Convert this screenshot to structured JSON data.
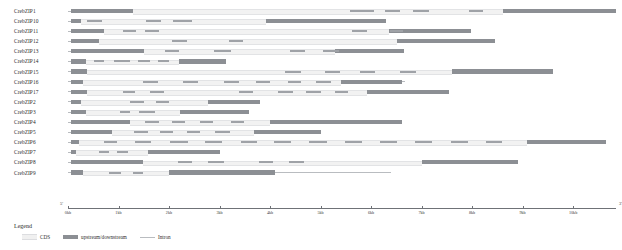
{
  "chart_data": {
    "type": "gene-structure-diagram",
    "title": "",
    "xlabel": "",
    "ylabel": "",
    "xlim": [
      0,
      10.85
    ],
    "x_unit": "kb",
    "axis_start_label": "5'",
    "axis_end_label": "3'",
    "grid": false,
    "tick_values": [
      0,
      1,
      2,
      3,
      4,
      5,
      6,
      7,
      8,
      9,
      10
    ],
    "tick_labels": [
      "0kb",
      "1kb",
      "2kb",
      "3kb",
      "4kb",
      "5kb",
      "6kb",
      "7kb",
      "8kb",
      "9kb",
      "10kb"
    ],
    "legend": {
      "title": "Legend",
      "position": "bottom-left",
      "entries": [
        {
          "name": "CDS",
          "color": "#f0f0f0",
          "shape": "block"
        },
        {
          "name": "upstream/downstream",
          "color": "#8c8f94",
          "shape": "block"
        },
        {
          "name": "Intron",
          "color": "#b9bcc0",
          "shape": "line"
        }
      ]
    },
    "categories": [
      "CrebZIP1",
      "CrebZIP10",
      "CrebZIP11",
      "CrebZIP12",
      "CrebZIP13",
      "CrebZIP14",
      "CrebZIP15",
      "CrebZIP16",
      "CrebZIP17",
      "CrebZIP2",
      "CrebZIP3",
      "CrebZIP4",
      "CrebZIP5",
      "CrebZIP6",
      "CrebZIP7",
      "CrebZIP8",
      "CrebZIP9"
    ],
    "genes": [
      {
        "name": "CrebZIP1",
        "span_kb": [
          0.0,
          10.85
        ],
        "features": [
          {
            "type": "upstream/downstream",
            "start_kb": 0.05,
            "end_kb": 1.28
          },
          {
            "type": "CDS",
            "start_kb": 1.28,
            "end_kb": 8.62
          },
          {
            "type": "exon",
            "start_kb": 5.59,
            "end_kb": 6.06
          },
          {
            "type": "exon",
            "start_kb": 6.28,
            "end_kb": 6.58
          },
          {
            "type": "exon",
            "start_kb": 6.83,
            "end_kb": 7.14
          },
          {
            "type": "exon",
            "start_kb": 7.93,
            "end_kb": 8.22
          },
          {
            "type": "upstream/downstream",
            "start_kb": 8.62,
            "end_kb": 10.85
          }
        ]
      },
      {
        "name": "CrebZIP10",
        "span_kb": [
          0.0,
          6.3
        ],
        "features": [
          {
            "type": "upstream/downstream",
            "start_kb": 0.05,
            "end_kb": 0.25
          },
          {
            "type": "CDS",
            "start_kb": 0.25,
            "end_kb": 3.92
          },
          {
            "type": "exon",
            "start_kb": 0.38,
            "end_kb": 0.68
          },
          {
            "type": "exon",
            "start_kb": 1.55,
            "end_kb": 1.85
          },
          {
            "type": "exon",
            "start_kb": 2.08,
            "end_kb": 2.46
          },
          {
            "type": "upstream/downstream",
            "start_kb": 3.92,
            "end_kb": 6.3
          }
        ]
      },
      {
        "name": "CrebZIP11",
        "span_kb": [
          0.0,
          7.97
        ],
        "features": [
          {
            "type": "upstream/downstream",
            "start_kb": 0.05,
            "end_kb": 0.72
          },
          {
            "type": "CDS",
            "start_kb": 0.72,
            "end_kb": 6.35
          },
          {
            "type": "exon",
            "start_kb": 1.08,
            "end_kb": 1.35
          },
          {
            "type": "exon",
            "start_kb": 1.53,
            "end_kb": 1.8
          },
          {
            "type": "exon",
            "start_kb": 5.62,
            "end_kb": 5.92
          },
          {
            "type": "exon",
            "start_kb": 6.38,
            "end_kb": 6.64
          },
          {
            "type": "upstream/downstream",
            "start_kb": 6.35,
            "end_kb": 7.97
          }
        ]
      },
      {
        "name": "CrebZIP12",
        "span_kb": [
          0.0,
          8.45
        ],
        "features": [
          {
            "type": "upstream/downstream",
            "start_kb": 0.05,
            "end_kb": 0.62
          },
          {
            "type": "CDS",
            "start_kb": 0.62,
            "end_kb": 6.52
          },
          {
            "type": "exon",
            "start_kb": 2.05,
            "end_kb": 2.36
          },
          {
            "type": "exon",
            "start_kb": 3.18,
            "end_kb": 3.46
          },
          {
            "type": "upstream/downstream",
            "start_kb": 6.52,
            "end_kb": 8.45
          }
        ]
      },
      {
        "name": "CrebZIP13",
        "span_kb": [
          0.0,
          6.66
        ],
        "features": [
          {
            "type": "upstream/downstream",
            "start_kb": 0.05,
            "end_kb": 1.5
          },
          {
            "type": "CDS",
            "start_kb": 1.5,
            "end_kb": 5.28
          },
          {
            "type": "exon",
            "start_kb": 1.92,
            "end_kb": 2.2
          },
          {
            "type": "exon",
            "start_kb": 2.9,
            "end_kb": 3.22
          },
          {
            "type": "exon",
            "start_kb": 4.4,
            "end_kb": 4.7
          },
          {
            "type": "exon",
            "start_kb": 5.05,
            "end_kb": 5.36
          },
          {
            "type": "upstream/downstream",
            "start_kb": 5.28,
            "end_kb": 6.66
          }
        ]
      },
      {
        "name": "CrebZIP14",
        "span_kb": [
          0.0,
          3.12
        ],
        "features": [
          {
            "type": "upstream/downstream",
            "start_kb": 0.05,
            "end_kb": 0.35
          },
          {
            "type": "CDS",
            "start_kb": 0.35,
            "end_kb": 2.2
          },
          {
            "type": "exon",
            "start_kb": 0.52,
            "end_kb": 0.72
          },
          {
            "type": "exon",
            "start_kb": 0.92,
            "end_kb": 1.22
          },
          {
            "type": "exon",
            "start_kb": 1.38,
            "end_kb": 1.62
          },
          {
            "type": "exon",
            "start_kb": 1.78,
            "end_kb": 2.0
          },
          {
            "type": "upstream/downstream",
            "start_kb": 2.2,
            "end_kb": 3.12
          }
        ]
      },
      {
        "name": "CrebZIP15",
        "span_kb": [
          0.0,
          9.6
        ],
        "features": [
          {
            "type": "upstream/downstream",
            "start_kb": 0.05,
            "end_kb": 0.38
          },
          {
            "type": "CDS",
            "start_kb": 0.38,
            "end_kb": 7.6
          },
          {
            "type": "exon",
            "start_kb": 4.3,
            "end_kb": 4.62
          },
          {
            "type": "exon",
            "start_kb": 5.08,
            "end_kb": 5.38
          },
          {
            "type": "exon",
            "start_kb": 5.78,
            "end_kb": 6.08
          },
          {
            "type": "exon",
            "start_kb": 6.58,
            "end_kb": 6.9
          },
          {
            "type": "upstream/downstream",
            "start_kb": 7.6,
            "end_kb": 9.6
          }
        ]
      },
      {
        "name": "CrebZIP16",
        "span_kb": [
          0.0,
          6.68
        ],
        "features": [
          {
            "type": "upstream/downstream",
            "start_kb": 0.05,
            "end_kb": 0.3
          },
          {
            "type": "CDS",
            "start_kb": 0.3,
            "end_kb": 5.4
          },
          {
            "type": "exon",
            "start_kb": 1.48,
            "end_kb": 1.78
          },
          {
            "type": "exon",
            "start_kb": 2.28,
            "end_kb": 2.58
          },
          {
            "type": "exon",
            "start_kb": 3.08,
            "end_kb": 3.38
          },
          {
            "type": "exon",
            "start_kb": 3.72,
            "end_kb": 4.0
          },
          {
            "type": "exon",
            "start_kb": 4.35,
            "end_kb": 4.62
          },
          {
            "type": "exon",
            "start_kb": 4.92,
            "end_kb": 5.2
          },
          {
            "type": "upstream/downstream",
            "start_kb": 5.4,
            "end_kb": 6.62
          }
        ]
      },
      {
        "name": "CrebZIP17",
        "span_kb": [
          0.0,
          7.55
        ],
        "features": [
          {
            "type": "upstream/downstream",
            "start_kb": 0.05,
            "end_kb": 0.38
          },
          {
            "type": "CDS",
            "start_kb": 0.38,
            "end_kb": 5.92
          },
          {
            "type": "exon",
            "start_kb": 1.08,
            "end_kb": 1.32
          },
          {
            "type": "exon",
            "start_kb": 1.62,
            "end_kb": 1.9
          },
          {
            "type": "exon",
            "start_kb": 3.38,
            "end_kb": 3.66
          },
          {
            "type": "exon",
            "start_kb": 4.15,
            "end_kb": 4.45
          },
          {
            "type": "exon",
            "start_kb": 4.72,
            "end_kb": 5.0
          },
          {
            "type": "exon",
            "start_kb": 5.28,
            "end_kb": 5.55
          },
          {
            "type": "upstream/downstream",
            "start_kb": 5.92,
            "end_kb": 7.55
          }
        ]
      },
      {
        "name": "CrebZIP2",
        "span_kb": [
          0.0,
          3.8
        ],
        "features": [
          {
            "type": "upstream/downstream",
            "start_kb": 0.05,
            "end_kb": 0.25
          },
          {
            "type": "CDS",
            "start_kb": 0.25,
            "end_kb": 2.78
          },
          {
            "type": "exon",
            "start_kb": 1.22,
            "end_kb": 1.5
          },
          {
            "type": "exon",
            "start_kb": 1.75,
            "end_kb": 2.0
          },
          {
            "type": "upstream/downstream",
            "start_kb": 2.78,
            "end_kb": 3.8
          }
        ]
      },
      {
        "name": "CrebZIP3",
        "span_kb": [
          0.0,
          3.58
        ],
        "features": [
          {
            "type": "upstream/downstream",
            "start_kb": 0.05,
            "end_kb": 0.35
          },
          {
            "type": "CDS",
            "start_kb": 0.35,
            "end_kb": 2.22
          },
          {
            "type": "exon",
            "start_kb": 1.02,
            "end_kb": 1.22
          },
          {
            "type": "exon",
            "start_kb": 1.4,
            "end_kb": 1.72
          },
          {
            "type": "upstream/downstream",
            "start_kb": 2.22,
            "end_kb": 3.58
          }
        ]
      },
      {
        "name": "CrebZIP4",
        "span_kb": [
          0.0,
          6.62
        ],
        "features": [
          {
            "type": "upstream/downstream",
            "start_kb": 0.05,
            "end_kb": 1.22
          },
          {
            "type": "CDS",
            "start_kb": 1.22,
            "end_kb": 4.0
          },
          {
            "type": "exon",
            "start_kb": 1.52,
            "end_kb": 1.8
          },
          {
            "type": "exon",
            "start_kb": 2.05,
            "end_kb": 2.32
          },
          {
            "type": "exon",
            "start_kb": 2.62,
            "end_kb": 2.88
          },
          {
            "type": "exon",
            "start_kb": 3.22,
            "end_kb": 3.48
          },
          {
            "type": "upstream/downstream",
            "start_kb": 4.0,
            "end_kb": 6.62
          }
        ]
      },
      {
        "name": "CrebZIP5",
        "span_kb": [
          0.0,
          5.0
        ],
        "features": [
          {
            "type": "upstream/downstream",
            "start_kb": 0.05,
            "end_kb": 0.88
          },
          {
            "type": "CDS",
            "start_kb": 0.88,
            "end_kb": 3.68
          },
          {
            "type": "exon",
            "start_kb": 1.3,
            "end_kb": 1.58
          },
          {
            "type": "exon",
            "start_kb": 1.82,
            "end_kb": 2.08
          },
          {
            "type": "exon",
            "start_kb": 2.35,
            "end_kb": 2.62
          },
          {
            "type": "exon",
            "start_kb": 2.92,
            "end_kb": 3.2
          },
          {
            "type": "upstream/downstream",
            "start_kb": 3.68,
            "end_kb": 5.0
          }
        ]
      },
      {
        "name": "CrebZIP6",
        "span_kb": [
          0.0,
          10.65
        ],
        "features": [
          {
            "type": "upstream/downstream",
            "start_kb": 0.05,
            "end_kb": 0.22
          },
          {
            "type": "CDS",
            "start_kb": 0.22,
            "end_kb": 9.08
          },
          {
            "type": "exon",
            "start_kb": 0.72,
            "end_kb": 0.98
          },
          {
            "type": "exon",
            "start_kb": 1.32,
            "end_kb": 1.65
          },
          {
            "type": "exon",
            "start_kb": 2.02,
            "end_kb": 2.38
          },
          {
            "type": "exon",
            "start_kb": 2.72,
            "end_kb": 3.05
          },
          {
            "type": "exon",
            "start_kb": 3.42,
            "end_kb": 3.75
          },
          {
            "type": "exon",
            "start_kb": 4.08,
            "end_kb": 4.42
          },
          {
            "type": "exon",
            "start_kb": 4.78,
            "end_kb": 5.12
          },
          {
            "type": "exon",
            "start_kb": 5.48,
            "end_kb": 5.82
          },
          {
            "type": "exon",
            "start_kb": 6.18,
            "end_kb": 6.52
          },
          {
            "type": "exon",
            "start_kb": 6.88,
            "end_kb": 7.2
          },
          {
            "type": "exon",
            "start_kb": 7.58,
            "end_kb": 7.92
          },
          {
            "type": "exon",
            "start_kb": 8.28,
            "end_kb": 8.6
          },
          {
            "type": "upstream/downstream",
            "start_kb": 9.08,
            "end_kb": 10.65
          }
        ]
      },
      {
        "name": "CrebZIP7",
        "span_kb": [
          0.0,
          3.0
        ],
        "features": [
          {
            "type": "upstream/downstream",
            "start_kb": 0.05,
            "end_kb": 0.16
          },
          {
            "type": "CDS",
            "start_kb": 0.16,
            "end_kb": 1.58
          },
          {
            "type": "exon",
            "start_kb": 0.62,
            "end_kb": 0.82
          },
          {
            "type": "exon",
            "start_kb": 0.98,
            "end_kb": 1.18
          },
          {
            "type": "upstream/downstream",
            "start_kb": 1.58,
            "end_kb": 3.0
          }
        ]
      },
      {
        "name": "CrebZIP8",
        "span_kb": [
          0.0,
          8.9
        ],
        "features": [
          {
            "type": "upstream/downstream",
            "start_kb": 0.05,
            "end_kb": 1.48
          },
          {
            "type": "CDS",
            "start_kb": 1.48,
            "end_kb": 7.0
          },
          {
            "type": "exon",
            "start_kb": 2.18,
            "end_kb": 2.45
          },
          {
            "type": "exon",
            "start_kb": 2.78,
            "end_kb": 3.08
          },
          {
            "type": "exon",
            "start_kb": 3.78,
            "end_kb": 4.05
          },
          {
            "type": "exon",
            "start_kb": 4.38,
            "end_kb": 4.68
          },
          {
            "type": "upstream/downstream",
            "start_kb": 7.0,
            "end_kb": 8.9
          }
        ]
      },
      {
        "name": "CrebZIP9",
        "span_kb": [
          0.0,
          6.4
        ],
        "features": [
          {
            "type": "upstream/downstream",
            "start_kb": 0.05,
            "end_kb": 0.3
          },
          {
            "type": "CDS",
            "start_kb": 0.3,
            "end_kb": 2.0
          },
          {
            "type": "exon",
            "start_kb": 0.82,
            "end_kb": 1.05
          },
          {
            "type": "exon",
            "start_kb": 1.28,
            "end_kb": 1.48
          },
          {
            "type": "upstream/downstream",
            "start_kb": 2.0,
            "end_kb": 4.1
          }
        ]
      }
    ]
  },
  "colors": {
    "cds": "#f0f0f0",
    "upstream_downstream": "#8c8f94",
    "intron": "#b9bcc0",
    "axis": "#6f7277",
    "text": "#2b2b2b"
  }
}
